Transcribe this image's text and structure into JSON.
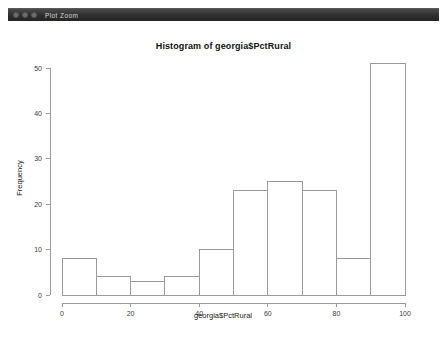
{
  "window": {
    "title": "Plot Zoom",
    "controls": [
      "close-button",
      "minimize-button",
      "maximize-button"
    ]
  },
  "chart_data": {
    "type": "bar",
    "title": "Histogram of georgia$PctRural",
    "xlabel": "georgia$PctRural",
    "ylabel": "Frequency",
    "categories": [
      "0-10",
      "10-20",
      "20-30",
      "30-40",
      "40-50",
      "50-60",
      "60-70",
      "70-80",
      "80-90",
      "90-100"
    ],
    "bin_edges": [
      0,
      10,
      20,
      30,
      40,
      50,
      60,
      70,
      80,
      90,
      100
    ],
    "values": [
      8,
      4,
      3,
      4,
      10,
      23,
      25,
      23,
      8,
      51
    ],
    "xlim": [
      0,
      100
    ],
    "ylim": [
      0,
      51
    ],
    "xticks": [
      0,
      20,
      40,
      60,
      80,
      100
    ],
    "yticks": [
      0,
      10,
      20,
      30,
      40,
      50
    ],
    "xtick_labels": [
      "0",
      "20",
      "40",
      "60",
      "80",
      "100"
    ],
    "ytick_labels": [
      "0",
      "10",
      "20",
      "30",
      "40",
      "50"
    ],
    "grid": false,
    "legend": null,
    "bar_fill": "#ffffff",
    "bar_stroke": "#9a9a9a"
  }
}
